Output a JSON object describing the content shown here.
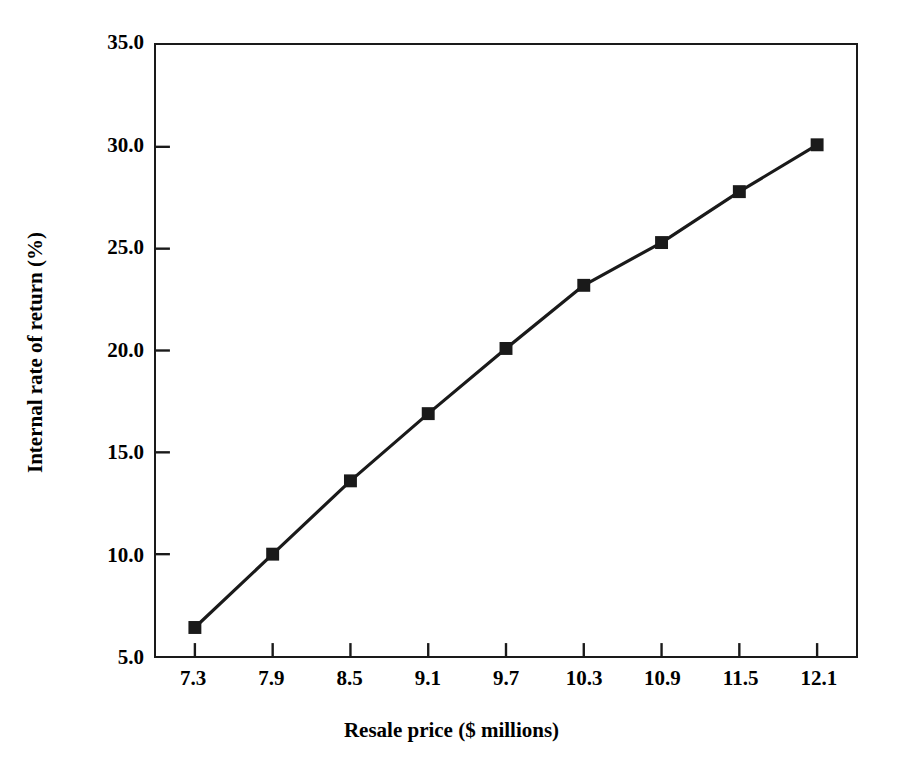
{
  "chart_data": {
    "type": "line",
    "title": "",
    "xlabel": "Resale price ($ millions)",
    "ylabel": "Internal rate of return (%)",
    "categories": [
      "7.3",
      "7.9",
      "8.5",
      "9.1",
      "9.7",
      "10.3",
      "10.9",
      "11.5",
      "12.1"
    ],
    "x": [
      7.3,
      7.9,
      8.5,
      9.1,
      9.7,
      10.3,
      10.9,
      11.5,
      12.1
    ],
    "values": [
      6.4,
      10.0,
      13.6,
      16.9,
      20.1,
      23.2,
      25.3,
      27.8,
      30.1
    ],
    "series": [
      {
        "name": "Internal rate of return",
        "values": [
          6.4,
          10.0,
          13.6,
          16.9,
          20.1,
          23.2,
          25.3,
          27.8,
          30.1
        ]
      }
    ],
    "ylim": [
      5.0,
      35.0
    ],
    "yticks": [
      "5.0",
      "10.0",
      "15.0",
      "20.0",
      "25.0",
      "30.0",
      "35.0"
    ],
    "ytick_values": [
      5.0,
      10.0,
      15.0,
      20.0,
      25.0,
      30.0,
      35.0
    ],
    "xticks": [
      "7.3",
      "7.9",
      "8.5",
      "9.1",
      "9.7",
      "10.3",
      "10.9",
      "11.5",
      "12.1"
    ],
    "grid": false,
    "legend": false,
    "legend_position": "none",
    "marker": "square",
    "line_color": "#1a1a1a",
    "marker_color": "#1a1a1a",
    "background_color": "#ffffff",
    "axis_color": "#1a1a1a"
  }
}
